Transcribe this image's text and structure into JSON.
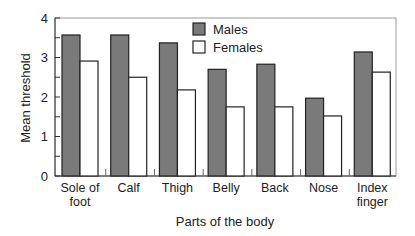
{
  "chart_data": {
    "type": "bar",
    "title": "",
    "xlabel": "Parts of the body",
    "ylabel": "Mean threshold",
    "ylim": [
      0,
      4
    ],
    "yticks": [
      0,
      1,
      2,
      3,
      4
    ],
    "grid": false,
    "legend_position": "top-center-inside",
    "categories": [
      "Sole of foot",
      "Calf",
      "Thigh",
      "Belly",
      "Back",
      "Nose",
      "Index finger"
    ],
    "category_lines": [
      [
        "Sole of",
        "foot"
      ],
      [
        "Calf"
      ],
      [
        "Thigh"
      ],
      [
        "Belly"
      ],
      [
        "Back"
      ],
      [
        "Nose"
      ],
      [
        "Index",
        "finger"
      ]
    ],
    "series": [
      {
        "name": "Males",
        "color": "#7a7a7a",
        "values": [
          3.57,
          3.57,
          3.37,
          2.7,
          2.83,
          1.97,
          3.14
        ]
      },
      {
        "name": "Females",
        "color": "#ffffff",
        "values": [
          2.91,
          2.5,
          2.18,
          1.75,
          1.75,
          1.52,
          2.63
        ]
      }
    ]
  }
}
